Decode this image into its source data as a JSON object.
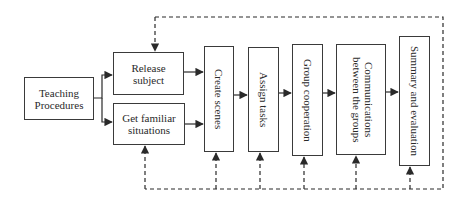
{
  "diagram": {
    "type": "flowchart",
    "nodes": {
      "start": {
        "label": "Teaching Procedures"
      },
      "release": {
        "label": "Release subject"
      },
      "familiar": {
        "label": "Get familiar situations"
      },
      "scenes": {
        "label": "Create scenes"
      },
      "tasks": {
        "label": "Assign tasks"
      },
      "coop": {
        "label": "Group cooperation"
      },
      "comm": {
        "label": "Communications between the groups"
      },
      "summary": {
        "label": "Summary and evaluation"
      }
    },
    "edges": [
      {
        "from": "Teaching Procedures",
        "to": "Release subject",
        "style": "solid"
      },
      {
        "from": "Teaching Procedures",
        "to": "Get familiar situations",
        "style": "solid"
      },
      {
        "from": "Release subject",
        "to": "Create scenes",
        "style": "solid"
      },
      {
        "from": "Get familiar situations",
        "to": "Create scenes",
        "style": "solid"
      },
      {
        "from": "Create scenes",
        "to": "Assign tasks",
        "style": "solid"
      },
      {
        "from": "Assign tasks",
        "to": "Group cooperation",
        "style": "solid"
      },
      {
        "from": "Group cooperation",
        "to": "Communications between the groups",
        "style": "solid"
      },
      {
        "from": "Communications between the groups",
        "to": "Summary and evaluation",
        "style": "solid"
      },
      {
        "from": "feedback-loop",
        "to": "Release subject",
        "style": "dashed"
      },
      {
        "from": "feedback-loop",
        "to": "Get familiar situations",
        "style": "dashed"
      },
      {
        "from": "feedback-loop",
        "to": "Create scenes",
        "style": "dashed"
      },
      {
        "from": "feedback-loop",
        "to": "Assign tasks",
        "style": "dashed"
      },
      {
        "from": "feedback-loop",
        "to": "Group cooperation",
        "style": "dashed"
      },
      {
        "from": "feedback-loop",
        "to": "Communications between the groups",
        "style": "dashed"
      },
      {
        "from": "feedback-loop",
        "to": "Summary and evaluation",
        "style": "dashed"
      }
    ],
    "colors": {
      "line": "#2a2a2a",
      "background": "#ffffff"
    }
  }
}
